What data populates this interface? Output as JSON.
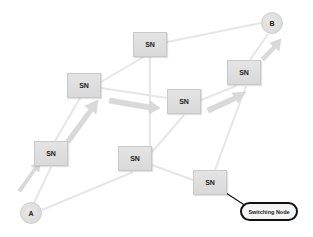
{
  "diagram": {
    "nodes": [
      {
        "id": "sn1",
        "label": "SN",
        "x": 133,
        "y": 32
      },
      {
        "id": "sn2",
        "label": "SN",
        "x": 67,
        "y": 73
      },
      {
        "id": "sn3",
        "label": "SN",
        "x": 167,
        "y": 89
      },
      {
        "id": "sn4",
        "label": "SN",
        "x": 227,
        "y": 60
      },
      {
        "id": "sn5",
        "label": "SN",
        "x": 34,
        "y": 141
      },
      {
        "id": "sn6",
        "label": "SN",
        "x": 118,
        "y": 146
      },
      {
        "id": "sn7",
        "label": "SN",
        "x": 193,
        "y": 170
      }
    ],
    "endpoints": {
      "a": {
        "label": "A"
      },
      "b": {
        "label": "B"
      }
    },
    "callout": {
      "label": "Switching Node"
    },
    "colors": {
      "node_fill": "#dedede",
      "link": "#e6e6e6",
      "path_arrow": "#d8d8d8",
      "callout_border": "#111111"
    }
  }
}
